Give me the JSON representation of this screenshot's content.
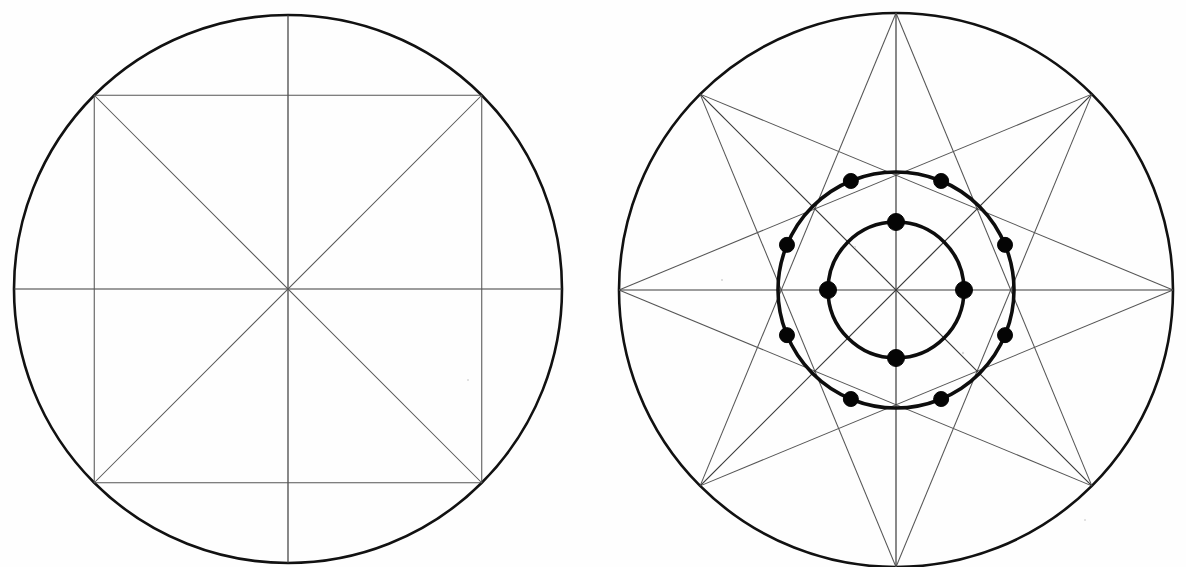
{
  "page": {
    "background_color": "#ffffff",
    "ink_color": "#111111",
    "thin_line_color": "#555555",
    "width": 1186,
    "height": 567
  },
  "figures": [
    {
      "id": "left-figure",
      "name": "circle-with-inscribed-square-and-diameters",
      "caption": "",
      "center": {
        "x": 288,
        "y": 289
      },
      "outer_radius": 274,
      "rings": [
        {
          "name": "outer-circle",
          "radius": 274,
          "stroke_width": 2.6
        }
      ],
      "vertices_deg": [
        0,
        45,
        90,
        135,
        180,
        225,
        270,
        315
      ],
      "chords": [
        {
          "from_deg": 45,
          "to_deg": 135
        },
        {
          "from_deg": 135,
          "to_deg": 225
        },
        {
          "from_deg": 225,
          "to_deg": 315
        },
        {
          "from_deg": 315,
          "to_deg": 45
        }
      ],
      "diameters": [
        {
          "from_deg": 90,
          "to_deg": 270
        },
        {
          "from_deg": 0,
          "to_deg": 180
        }
      ],
      "diagonals": [
        {
          "from_deg": 45,
          "to_deg": 225
        },
        {
          "from_deg": 135,
          "to_deg": 315
        }
      ],
      "dots": []
    },
    {
      "id": "right-figure",
      "name": "octagram-star-with-two-concentric-circles",
      "caption": "",
      "center": {
        "x": 896,
        "y": 290
      },
      "outer_radius": 277,
      "rings": [
        {
          "name": "outer-circle",
          "radius": 277,
          "stroke_width": 2.6
        },
        {
          "name": "middle-circle",
          "radius": 118,
          "stroke_width": 3.6
        },
        {
          "name": "inner-circle",
          "radius": 68,
          "stroke_width": 3.6
        }
      ],
      "vertices_deg": [
        90,
        45,
        0,
        315,
        270,
        225,
        180,
        135
      ],
      "star_type": "{8/3} octagram",
      "star_step": 3,
      "diameters": [
        {
          "from_deg": 90,
          "to_deg": 270
        },
        {
          "from_deg": 0,
          "to_deg": 180
        },
        {
          "from_deg": 45,
          "to_deg": 225
        },
        {
          "from_deg": 135,
          "to_deg": 315
        }
      ],
      "dots": [
        {
          "ring": "middle-circle",
          "angle_deg": 67.5,
          "radius_px": 7.5
        },
        {
          "ring": "middle-circle",
          "angle_deg": 112.5,
          "radius_px": 7.5
        },
        {
          "ring": "middle-circle",
          "angle_deg": 157.5,
          "radius_px": 7.5
        },
        {
          "ring": "middle-circle",
          "angle_deg": 202.5,
          "radius_px": 7.5
        },
        {
          "ring": "middle-circle",
          "angle_deg": 247.5,
          "radius_px": 7.5
        },
        {
          "ring": "middle-circle",
          "angle_deg": 292.5,
          "radius_px": 7.5
        },
        {
          "ring": "middle-circle",
          "angle_deg": 337.5,
          "radius_px": 7.5
        },
        {
          "ring": "middle-circle",
          "angle_deg": 22.5,
          "radius_px": 7.5
        },
        {
          "ring": "inner-circle",
          "angle_deg": 90,
          "radius_px": 8.5
        },
        {
          "ring": "inner-circle",
          "angle_deg": 0,
          "radius_px": 8.5
        },
        {
          "ring": "inner-circle",
          "angle_deg": 270,
          "radius_px": 8.5
        },
        {
          "ring": "inner-circle",
          "angle_deg": 180,
          "radius_px": 8.5
        }
      ],
      "dot_count_middle": 8,
      "dot_count_inner": 4
    }
  ],
  "labels": {
    "left_figure_label": "",
    "right_figure_label": ""
  }
}
